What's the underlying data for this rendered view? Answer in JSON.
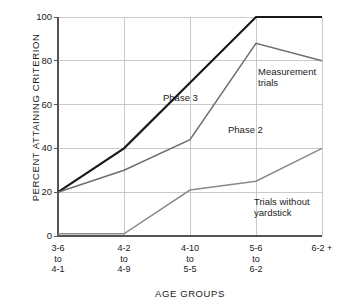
{
  "chart_data": {
    "type": "line",
    "title": "",
    "xlabel": "AGE GROUPS",
    "ylabel": "PERCENT ATTAINING CRITERION",
    "ylim": [
      0,
      100
    ],
    "yticks": [
      0,
      20,
      40,
      60,
      80,
      100
    ],
    "grid": true,
    "legend_position": "inline-annotations",
    "categories": [
      {
        "line1": "3-6",
        "line2": "to",
        "line3": "4-1"
      },
      {
        "line1": "4-2",
        "line2": "to",
        "line3": "4-9"
      },
      {
        "line1": "4-10",
        "line2": "to",
        "line3": "5-5"
      },
      {
        "line1": "5-6",
        "line2": "to",
        "line3": "6-2"
      },
      {
        "line1": "6-2 +",
        "line2": "",
        "line3": ""
      }
    ],
    "series": [
      {
        "name": "Phase 3",
        "color": "#1a1a1a",
        "width": 2.2,
        "values": [
          20,
          40,
          70,
          100,
          100
        ]
      },
      {
        "name": "Phase 2",
        "color": "#6e6e6e",
        "width": 1.5,
        "values": [
          20,
          30,
          44,
          88,
          80
        ]
      },
      {
        "name": "Trials without yardstick",
        "color": "#8a8a8a",
        "width": 1.5,
        "values": [
          1,
          1,
          21,
          25,
          40
        ]
      }
    ],
    "annotations": [
      {
        "name": "phase-3",
        "text": "Phase 3",
        "x": 163,
        "y": 92
      },
      {
        "name": "phase-2",
        "text": "Phase 2",
        "x": 228,
        "y": 124
      },
      {
        "name": "measurement-trials",
        "line1": "Measurement",
        "line2": "trials",
        "x": 258,
        "y": 66
      },
      {
        "name": "trials-without-yardstick",
        "line1": "Trials without",
        "line2": "yardstick",
        "x": 254,
        "y": 196
      }
    ],
    "ytick_labels": [
      "0",
      "20",
      "40",
      "60",
      "80",
      "100"
    ],
    "axis_color": "#555555",
    "grid_color": "#bdbdbd"
  }
}
